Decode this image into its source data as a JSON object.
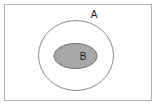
{
  "diagram": {
    "type": "set-diagram",
    "canvas": {
      "width": 161,
      "height": 111,
      "background_color": "#ffffff"
    },
    "universe": {
      "name": "universal-set-rectangle",
      "x": 4.5,
      "y": 4.5,
      "width": 147,
      "height": 96,
      "fill_color": "#ffffff",
      "stroke_color": "#b3b3b3",
      "stroke_width": 1
    },
    "sets": [
      {
        "id": "set-a",
        "label": "A",
        "shape": "ellipse",
        "cx": 76,
        "cy": 55.5,
        "rx": 37.5,
        "ry": 35,
        "fill_color": "#ffffff",
        "stroke_color": "#8a8a8a",
        "stroke_width": 1,
        "label_x": 94,
        "label_y": 15,
        "label_color": "#1a1a1a"
      },
      {
        "id": "set-b",
        "label": "B",
        "shape": "ellipse",
        "cx": 75.5,
        "cy": 56,
        "rx": 21.5,
        "ry": 12.5,
        "fill_color": "#a8a8a8",
        "stroke_color": "#6e6e6e",
        "stroke_width": 1,
        "label_x": 83,
        "label_y": 57,
        "label_color": "#1a1a1a"
      }
    ]
  }
}
